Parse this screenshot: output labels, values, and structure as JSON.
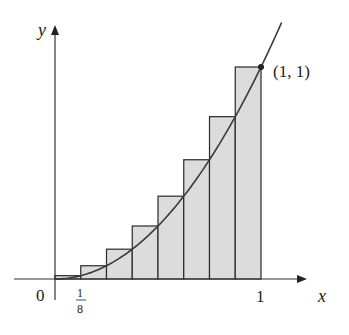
{
  "chart_data": {
    "type": "bar",
    "title": "",
    "function": "y = x^2",
    "interval": [
      0,
      1
    ],
    "n_rectangles": 8,
    "rectangle_width": 0.125,
    "categories": [
      "0-1/8",
      "1/8-2/8",
      "2/8-3/8",
      "3/8-4/8",
      "4/8-5/8",
      "5/8-6/8",
      "6/8-7/8",
      "7/8-1"
    ],
    "values": [
      0.015625,
      0.0625,
      0.140625,
      0.25,
      0.390625,
      0.5625,
      0.765625,
      1.0
    ],
    "xlabel": "x",
    "ylabel": "y",
    "xlim": [
      0,
      1.08
    ],
    "ylim": [
      0,
      1.07
    ],
    "grid": false,
    "legend": null,
    "x_tick_labels": [
      "0",
      "1/8",
      "1"
    ],
    "annotations": [
      {
        "text": "(1, 1)",
        "x": 1,
        "y": 1
      }
    ]
  },
  "labels": {
    "x_axis": "x",
    "y_axis": "y",
    "origin": "0",
    "tick_eighth_num": "1",
    "tick_eighth_den": "8",
    "tick_one": "1",
    "point": "(1, 1)"
  },
  "colors": {
    "rect_fill": "#dcdcdc",
    "stroke": "#2a2a2a",
    "curve": "#3a3a3a"
  }
}
